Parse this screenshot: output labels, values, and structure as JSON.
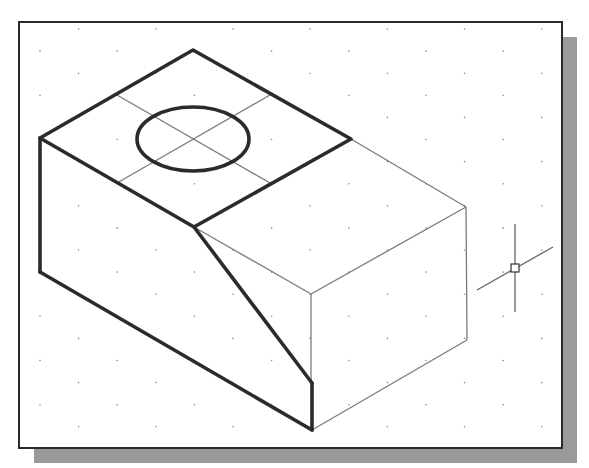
{
  "canvas": {
    "width": 589,
    "height": 468,
    "background": "#ffffff"
  },
  "viewport": {
    "frame": {
      "x": 19,
      "y": 22,
      "width": 543,
      "height": 426,
      "stroke": "#2a2a2a",
      "stroke_width": 2
    },
    "shadow": {
      "offset": 15,
      "color": "#9a9a9a"
    },
    "grid": {
      "x0": 40,
      "y0": 29,
      "dx": 38.6,
      "dy": 22.1,
      "cols": 14,
      "rows": 19,
      "dot_color": "#8a8a8a",
      "dot_radius": 0.8
    }
  },
  "model": {
    "heavy_color": "#2b2b2b",
    "heavy_width": 3.6,
    "light_color": "#7a7a7a",
    "light_width": 1.3,
    "heavy_polylines": [
      {
        "name": "top-face-outline",
        "points": "40,138 193,50 351,139 194,227 40,138"
      },
      {
        "name": "left-vertical-edge",
        "points": "40,138 40,272"
      },
      {
        "name": "bottom-left-edge",
        "points": "40,272 312,430"
      },
      {
        "name": "front-vertical-edge",
        "points": "312,430 312,383"
      },
      {
        "name": "bevel-edge",
        "points": "194,227 312,383"
      }
    ],
    "light_polylines": [
      {
        "name": "back-right-top-edge",
        "points": "351,139 466,207"
      },
      {
        "name": "right-top-edge",
        "points": "466,207 311,294"
      },
      {
        "name": "bevel-to-corner-edge",
        "points": "194,227 311,294"
      },
      {
        "name": "corner-vertical-edge",
        "points": "311,294 311,383"
      },
      {
        "name": "right-vertical-edge",
        "points": "466,207 467,340"
      },
      {
        "name": "right-bottom-edge",
        "points": "467,340 312,430"
      },
      {
        "name": "centerline-a",
        "points": "117,95 270,183"
      },
      {
        "name": "centerline-b",
        "points": "117,183 270,95"
      }
    ],
    "hole": {
      "cx": 193,
      "cy": 139,
      "rx": 56,
      "ry": 32
    }
  },
  "cursor": {
    "cx": 515,
    "cy": 268,
    "box": 8,
    "vertical": {
      "y1": 224,
      "y2": 312
    },
    "isoline": {
      "x1": 477,
      "y1": 290,
      "x2": 553,
      "y2": 247
    },
    "color": "#666666"
  }
}
